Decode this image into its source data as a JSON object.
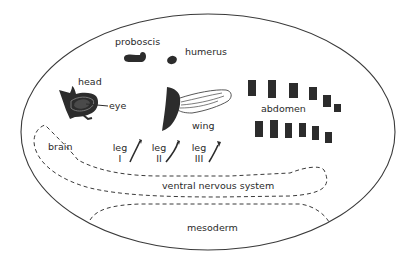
{
  "diagram": {
    "title": "",
    "outer_shape": "embryo outline (ellipse)",
    "colors": {
      "outline": "#3a3a3a",
      "disc_fill": "#2c2c2c",
      "eye_fill": "#4a4a4a",
      "label": "#2a2a2a",
      "background": "#ffffff"
    },
    "labels": {
      "proboscis": "proboscis",
      "humerus": "humerus",
      "head": "head",
      "eye": "eye",
      "wing": "wing",
      "abdomen": "abdomen",
      "brain": "brain",
      "leg_1_word": "leg",
      "leg_1_num": "I",
      "leg_2_word": "leg",
      "leg_2_num": "II",
      "leg_3_word": "leg",
      "leg_3_num": "III",
      "ventral_nervous_system": "ventral nervous system",
      "mesoderm": "mesoderm"
    },
    "structures": [
      {
        "id": "proboscis",
        "type": "imaginal-disc"
      },
      {
        "id": "humerus",
        "type": "imaginal-disc"
      },
      {
        "id": "eye-antenna",
        "type": "imaginal-disc"
      },
      {
        "id": "wing",
        "type": "imaginal-disc"
      },
      {
        "id": "leg-I",
        "type": "imaginal-disc"
      },
      {
        "id": "leg-II",
        "type": "imaginal-disc"
      },
      {
        "id": "leg-III",
        "type": "imaginal-disc"
      },
      {
        "id": "abdomen",
        "type": "histoblast-nests",
        "count_top_row": 6,
        "count_bottom_row": 6
      },
      {
        "id": "brain",
        "type": "dashed-region"
      },
      {
        "id": "ventral-nervous-system",
        "type": "dashed-region"
      },
      {
        "id": "mesoderm",
        "type": "dashed-region"
      }
    ]
  }
}
